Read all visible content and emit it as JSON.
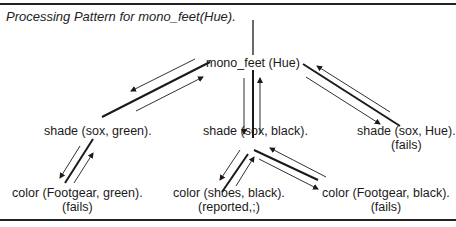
{
  "caption": "Processing Pattern for mono_feet(Hue).",
  "nodes": {
    "root": {
      "label": "mono_feet (Hue)"
    },
    "shade_green": {
      "label": "shade (sox, green)."
    },
    "shade_black": {
      "label": "shade (sox, black)."
    },
    "shade_hue": {
      "label": "shade (sox, Hue).",
      "status": "(fails)"
    },
    "color_footgear_green": {
      "label": "color (Footgear, green).",
      "status": "(fails)"
    },
    "color_shoes_black": {
      "label": "color (shoes, black).",
      "status": "(reported,;)"
    },
    "color_footgear_black": {
      "label": "color (Footgear, black).",
      "status": "(fails)"
    }
  },
  "colors": {
    "ink": "#1a1a1a",
    "background": "#ffffff"
  }
}
